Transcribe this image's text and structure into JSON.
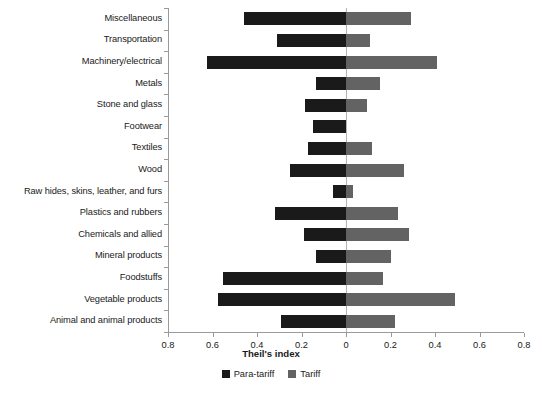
{
  "chart_data": {
    "type": "bar",
    "orientation": "horizontal",
    "layout": "diverging-bidirectional",
    "title": "",
    "xlabel": "Theil's index",
    "ylabel": "",
    "xlim": [
      -0.8,
      0.8
    ],
    "xticks": [
      -0.8,
      -0.6,
      -0.4,
      -0.2,
      0,
      0.2,
      0.4,
      0.6,
      0.8
    ],
    "xticklabels": [
      "0.8",
      "0.6",
      "0.4",
      "0.2",
      "0",
      "0.2",
      "0.4",
      "0.6",
      "0.8"
    ],
    "grid": false,
    "legend_position": "bottom-center",
    "categories": [
      "Miscellaneous",
      "Transportation",
      "Machinery/electrical",
      "Metals",
      "Stone and glass",
      "Footwear",
      "Textiles",
      "Wood",
      "Raw hides, skins, leather, and furs",
      "Plastics and rubbers",
      "Chemicals and allied",
      "Mineral products",
      "Foodstuffs",
      "Vegetable products",
      "Animal and animal products"
    ],
    "series": [
      {
        "name": "Para-tariff",
        "color": "#1a1a1a",
        "direction": "left",
        "values": [
          0.46,
          0.31,
          0.625,
          0.135,
          0.185,
          0.15,
          0.17,
          0.25,
          0.06,
          0.32,
          0.19,
          0.135,
          0.555,
          0.575,
          0.29
        ]
      },
      {
        "name": "Tariff",
        "color": "#636363",
        "direction": "right",
        "values": [
          0.29,
          0.11,
          0.41,
          0.155,
          0.095,
          0.0,
          0.115,
          0.26,
          0.03,
          0.235,
          0.285,
          0.2,
          0.165,
          0.49,
          0.22
        ]
      }
    ]
  },
  "legend": {
    "items": [
      {
        "label": "Para-tariff",
        "color": "#1a1a1a"
      },
      {
        "label": "Tariff",
        "color": "#636363"
      }
    ]
  },
  "axis": {
    "x_title": "Theil's index"
  }
}
